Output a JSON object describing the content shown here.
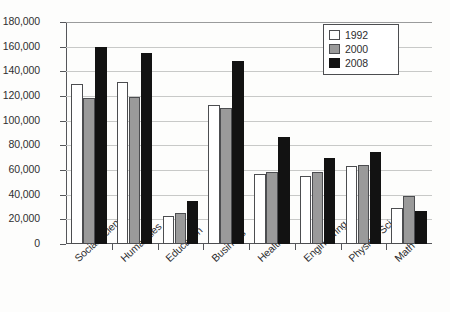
{
  "chart_data": {
    "type": "bar",
    "title": "",
    "subtitle": "",
    "xlabel": "",
    "ylabel": "",
    "ylim": [
      0,
      180000
    ],
    "ytick_step": 20000,
    "ytick_labels": [
      "0",
      "20,000",
      "40,000",
      "60,000",
      "80,000",
      "100,000",
      "120,000",
      "140,000",
      "160,000",
      "180,000"
    ],
    "ytick_values": [
      0,
      20000,
      40000,
      60000,
      80000,
      100000,
      120000,
      140000,
      160000,
      180000
    ],
    "grid": "horizontal",
    "legend_position": "top-right",
    "categories": [
      "Social Science",
      "Humanities",
      "Education",
      "Business",
      "Health",
      "Engineering",
      "Physical Sci",
      "Math"
    ],
    "series": [
      {
        "name": "1992",
        "color": "#ffffff",
        "values": [
          130000,
          131000,
          23000,
          113000,
          57000,
          55000,
          63000,
          29000
        ]
      },
      {
        "name": "2000",
        "color": "#9a9a9a",
        "values": [
          118000,
          119000,
          25000,
          110000,
          58000,
          58000,
          64000,
          39000
        ]
      },
      {
        "name": "2008",
        "color": "#121212",
        "values": [
          160000,
          155000,
          35000,
          148000,
          87000,
          70000,
          75000,
          27000
        ]
      }
    ]
  },
  "legend": {
    "items": [
      {
        "label": "1992"
      },
      {
        "label": "2000"
      },
      {
        "label": "2008"
      }
    ]
  }
}
